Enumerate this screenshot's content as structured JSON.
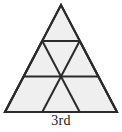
{
  "figure": {
    "name": "subdivided-equilateral-triangle",
    "caption": "3rd",
    "iteration_label": "3rd",
    "iteration_number": 3,
    "rows": 3,
    "small_triangle_count": 9,
    "upward_triangle_count": 6,
    "downward_triangle_count": 3,
    "colors": {
      "background": "#ffffff",
      "fill": "#efefef",
      "stroke": "#2b2b2b",
      "caption": "#1a1a1a"
    },
    "geometry": {
      "apex": [
        61,
        5
      ],
      "bottom_left": [
        5,
        112
      ],
      "bottom_right": [
        117,
        112
      ],
      "stroke_width": 2,
      "row_divider_y": [
        41,
        76
      ]
    },
    "outline_points": "61,5 117,112 5,112",
    "internal_lines": [
      {
        "name": "divider-row-1",
        "x1": 42.3,
        "y1": 41,
        "x2": 79.7,
        "y2": 41
      },
      {
        "name": "divider-row-2",
        "x1": 23.7,
        "y1": 76.5,
        "x2": 98.3,
        "y2": 76.5
      },
      {
        "name": "left-parallel-upper",
        "x1": 42.3,
        "y1": 41,
        "x2": 23.7,
        "y2": 76.5
      },
      {
        "name": "left-parallel-lower",
        "x1": 23.7,
        "y1": 76.5,
        "x2": 5,
        "y2": 112
      },
      {
        "name": "left-diagonal-mid",
        "x1": 79.7,
        "y1": 41,
        "x2": 61,
        "y2": 76.5
      },
      {
        "name": "left-diagonal-low",
        "x1": 61,
        "y1": 76.5,
        "x2": 42.3,
        "y2": 112
      },
      {
        "name": "right-parallel-upper",
        "x1": 79.7,
        "y1": 41,
        "x2": 98.3,
        "y2": 76.5
      },
      {
        "name": "right-parallel-lower",
        "x1": 98.3,
        "y1": 76.5,
        "x2": 117,
        "y2": 112
      },
      {
        "name": "right-diagonal-mid",
        "x1": 42.3,
        "y1": 41,
        "x2": 61,
        "y2": 76.5
      },
      {
        "name": "right-diagonal-low",
        "x1": 61,
        "y1": 76.5,
        "x2": 79.7,
        "y2": 112
      }
    ]
  }
}
